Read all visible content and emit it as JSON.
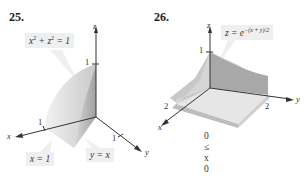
{
  "figures": [
    {
      "number": "25.",
      "surface_label_left": "x",
      "surface_label_sup1": "2",
      "surface_label_mid": " + z",
      "surface_label_sup2": "2",
      "surface_label_right": " = 1",
      "plane_label_1": "x = 1",
      "plane_label_2": "y = x",
      "axes": {
        "x": "x",
        "y": "y",
        "z": "z"
      },
      "ticks": {
        "x": "1",
        "y": "1",
        "z": "1"
      },
      "colors": {
        "lit_face": "#e6e6e6",
        "shaded_face": "#b8b8b8",
        "dark_face": "#9c9c9c"
      }
    },
    {
      "number": "26.",
      "surface_label_base": "z = e",
      "surface_label_exp": "−(x + y)/2",
      "axes": {
        "x": "x",
        "y": "y",
        "z": "z"
      },
      "ticks": {
        "x": "2",
        "y": "2",
        "z": "1"
      },
      "constraints": [
        "0 ≤ x",
        "0 ≤ y"
      ],
      "colors": {
        "top_face": "#e3e3e3",
        "back_face": "#a8a8a8",
        "side_face": "#c4c4c4"
      }
    }
  ]
}
